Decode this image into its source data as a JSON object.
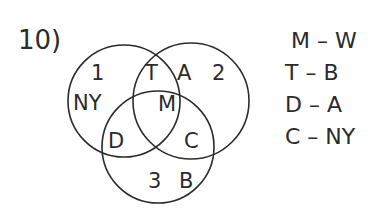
{
  "question": {
    "number": "10)"
  },
  "venn": {
    "circles": [
      {
        "id": "circle-1",
        "label": "1",
        "cx": 124,
        "cy": 101,
        "r": 56
      },
      {
        "id": "circle-2",
        "label": "2",
        "cx": 191,
        "cy": 101,
        "r": 58
      },
      {
        "id": "circle-3",
        "label": "3",
        "cx": 158,
        "cy": 147,
        "r": 56
      }
    ],
    "region_labels": {
      "label_1": "1",
      "label_2": "2",
      "label_3": "3",
      "only_1": "NY",
      "one_and_two": "T",
      "only_two_near": "A",
      "center_all": "M",
      "one_and_three": "D",
      "two_and_three": "C",
      "only_three": "B"
    }
  },
  "pairs": [
    {
      "left": "M",
      "dash": "–",
      "right": "W"
    },
    {
      "left": "T",
      "dash": "–",
      "right": "B"
    },
    {
      "left": "D",
      "dash": "–",
      "right": "A"
    },
    {
      "left": "C",
      "dash": "–",
      "right": "NY"
    }
  ],
  "pair_strings": [
    "M – W",
    "T – B",
    "D – A",
    "C – NY"
  ]
}
